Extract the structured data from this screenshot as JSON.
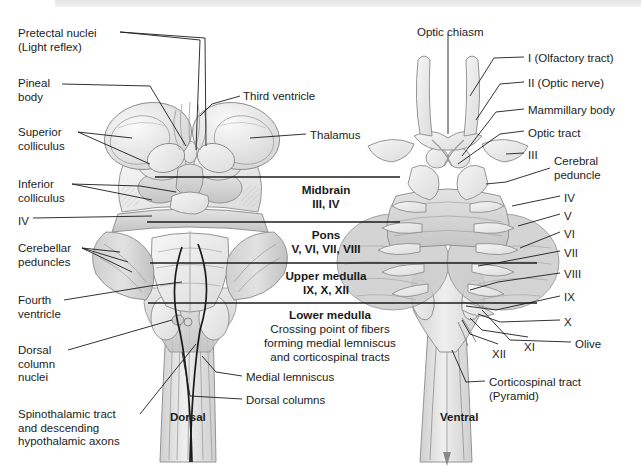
{
  "figure": {
    "title_dorsal": "Dorsal",
    "title_ventral": "Ventral"
  },
  "left_labels": [
    {
      "id": "pretectal-nuclei",
      "text": "Pretectal nuclei\n(Light reflex)",
      "x": 18,
      "y": 27
    },
    {
      "id": "pineal-body",
      "text": "Pineal\nbody",
      "x": 18,
      "y": 77
    },
    {
      "id": "superior-colliculus",
      "text": "Superior\ncolliculus",
      "x": 18,
      "y": 126
    },
    {
      "id": "inferior-colliculus",
      "text": "Inferior\ncolliculus",
      "x": 18,
      "y": 178
    },
    {
      "id": "cn-iv-dorsal",
      "text": "IV",
      "x": 18,
      "y": 215
    },
    {
      "id": "cerebellar-peduncles",
      "text": "Cerebellar\npeduncles",
      "x": 18,
      "y": 242
    },
    {
      "id": "fourth-ventricle",
      "text": "Fourth\nventricle",
      "x": 18,
      "y": 294
    },
    {
      "id": "dorsal-column-nuclei",
      "text": "Dorsal\ncolumn\nnuclei",
      "x": 18,
      "y": 344
    },
    {
      "id": "spinothalamic-tract",
      "text": "Spinothalamic tract\nand descending\nhypothalamic axons",
      "x": 18,
      "y": 408
    }
  ],
  "center_labels": [
    {
      "id": "third-ventricle",
      "text": "Third ventricle",
      "x": 243,
      "y": 90
    },
    {
      "id": "thalamus",
      "text": "Thalamus",
      "x": 310,
      "y": 129
    },
    {
      "id": "medial-lemniscus",
      "text": "Medial lemniscus",
      "x": 246,
      "y": 371
    },
    {
      "id": "dorsal-columns",
      "text": "Dorsal columns",
      "x": 246,
      "y": 394
    }
  ],
  "top_labels": [
    {
      "id": "optic-chiasm",
      "text": "Optic chiasm",
      "x": 417,
      "y": 26
    }
  ],
  "right_labels": [
    {
      "id": "cn-i-olfactory",
      "text": "I (Olfactory tract)",
      "x": 528,
      "y": 52
    },
    {
      "id": "cn-ii-optic",
      "text": "II (Optic nerve)",
      "x": 528,
      "y": 77
    },
    {
      "id": "mammillary-body",
      "text": "Mammillary body",
      "x": 528,
      "y": 104
    },
    {
      "id": "optic-tract",
      "text": "Optic tract",
      "x": 528,
      "y": 127
    },
    {
      "id": "cn-iii",
      "text": "III",
      "x": 528,
      "y": 149
    },
    {
      "id": "cerebral-peduncle",
      "text": "Cerebral\npeduncle",
      "x": 554,
      "y": 155
    },
    {
      "id": "cn-iv",
      "text": "IV",
      "x": 564,
      "y": 192
    },
    {
      "id": "cn-v",
      "text": "V",
      "x": 564,
      "y": 210
    },
    {
      "id": "cn-vi",
      "text": "VI",
      "x": 564,
      "y": 228
    },
    {
      "id": "cn-vii",
      "text": "VII",
      "x": 564,
      "y": 247
    },
    {
      "id": "cn-viii",
      "text": "VIII",
      "x": 564,
      "y": 268
    },
    {
      "id": "cn-ix",
      "text": "IX",
      "x": 564,
      "y": 291
    },
    {
      "id": "cn-x",
      "text": "X",
      "x": 564,
      "y": 316
    },
    {
      "id": "olive",
      "text": "Olive",
      "x": 575,
      "y": 338
    },
    {
      "id": "cn-xii",
      "text": "XII",
      "x": 492,
      "y": 348
    },
    {
      "id": "cn-xi",
      "text": "XI",
      "x": 524,
      "y": 341
    },
    {
      "id": "corticospinal-tract",
      "text": "Corticospinal tract\n(Pyramid)",
      "x": 489,
      "y": 376
    }
  ],
  "bands": [
    {
      "id": "midbrain",
      "title": "Midbrain",
      "nerves": "III, IV",
      "x": 255,
      "y": 183,
      "w": 142
    },
    {
      "id": "pons",
      "title": "Pons",
      "nerves": "V, VI, VII, VIII",
      "x": 255,
      "y": 228,
      "w": 142
    },
    {
      "id": "upper-medulla",
      "title": "Upper medulla",
      "nerves": "IX, X, XII",
      "x": 255,
      "y": 269,
      "w": 142
    },
    {
      "id": "lower-medulla",
      "title": "Lower medulla",
      "nerves": "Crossing point of fibers\nforming medial lemniscus\nand corticospinal tracts",
      "x": 240,
      "y": 308,
      "w": 180
    }
  ],
  "band_dividers": [
    177,
    222,
    263,
    303
  ],
  "colors": {
    "ink": "#1c1c1c",
    "tissue_light": "#f0f0f0",
    "tissue_mid": "#d8d8d8",
    "tissue_dark": "#b3b3b3",
    "outline": "#8a8a8a",
    "band_top": "#e6e6e6"
  }
}
